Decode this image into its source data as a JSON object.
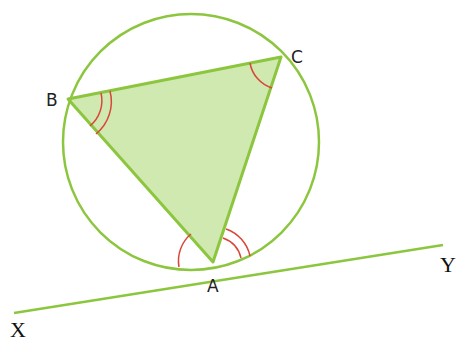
{
  "diagram": {
    "colors": {
      "line": "#8cc63f",
      "fill": "#cfe9b0",
      "angle_marks": "#d9463a",
      "text": "#222222"
    },
    "points": {
      "A": {
        "label": "A",
        "x": 213,
        "y": 262
      },
      "B": {
        "label": "B",
        "x": 68,
        "y": 99
      },
      "C": {
        "label": "C",
        "x": 281,
        "y": 57
      },
      "X": {
        "label": "X",
        "x": 14,
        "y": 315
      },
      "Y": {
        "label": "Y",
        "x": 443,
        "y": 245
      }
    },
    "circle": {
      "cx": 191,
      "cy": 142,
      "r": 128
    },
    "tangent": {
      "from": "X",
      "to": "Y"
    },
    "triangle": [
      "A",
      "B",
      "C"
    ],
    "angle_marks": [
      {
        "at": "B",
        "arcs": 2
      },
      {
        "at": "C",
        "arcs": 1
      },
      {
        "at": "A",
        "between": "XA-AB",
        "arcs": 1
      },
      {
        "at": "A",
        "between": "AC-AY",
        "arcs": 2
      }
    ]
  }
}
